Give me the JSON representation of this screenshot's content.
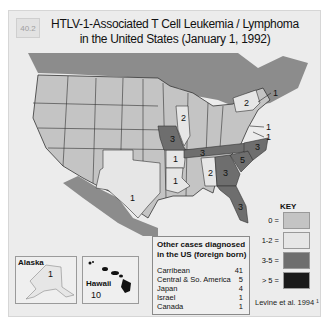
{
  "figure": {
    "number": "40.2",
    "title_line1": "HTLV-1-Associated T Cell Leukemia / Lymphoma",
    "title_line2": "in the United States (January 1, 1992)"
  },
  "colors": {
    "zero": "#c4c4c4",
    "one_two": "#e6e6e6",
    "three_five": "#6e6e6e",
    "gt_five": "#1a1a1a",
    "canada": "#8c8c8c",
    "mexico": "#8c8c8c",
    "water": "#ececec"
  },
  "states": [
    {
      "name": "Massachusetts area",
      "value": "1"
    },
    {
      "name": "New York",
      "value": "2"
    },
    {
      "name": "Maryland area",
      "value": "1"
    },
    {
      "name": "Virginia area",
      "value": "1"
    },
    {
      "name": "Illinois",
      "value": "2"
    },
    {
      "name": "Missouri",
      "value": "3"
    },
    {
      "name": "Tennessee",
      "value": "3"
    },
    {
      "name": "North Carolina",
      "value": "3"
    },
    {
      "name": "South Carolina",
      "value": "5"
    },
    {
      "name": "Georgia",
      "value": "3"
    },
    {
      "name": "Alabama",
      "value": "2"
    },
    {
      "name": "Florida",
      "value": "3"
    },
    {
      "name": "Arkansas",
      "value": "1"
    },
    {
      "name": "Louisiana",
      "value": "1"
    },
    {
      "name": "Texas",
      "value": "1"
    }
  ],
  "insets": {
    "alaska": {
      "name": "Alaska",
      "value": "1"
    },
    "hawaii": {
      "name": "Hawaii",
      "value": "10"
    }
  },
  "other_cases": {
    "header": "Other cases diagnosed in the US (foreign born)",
    "rows": [
      {
        "origin": "Carribean",
        "count": "41"
      },
      {
        "origin": "Central & So. America",
        "count": "5"
      },
      {
        "origin": "Japan",
        "count": "4"
      },
      {
        "origin": "Israel",
        "count": "1"
      },
      {
        "origin": "Canada",
        "count": "1"
      }
    ]
  },
  "key": {
    "title": "KEY",
    "items": [
      {
        "label": "0 =",
        "color": "#c4c4c4"
      },
      {
        "label": "1-2 =",
        "color": "#e6e6e6"
      },
      {
        "label": "3-5 =",
        "color": "#6e6e6e"
      },
      {
        "label": "> 5 =",
        "color": "#1a1a1a"
      }
    ]
  },
  "citation": "Levine et al. 1994 ¹"
}
